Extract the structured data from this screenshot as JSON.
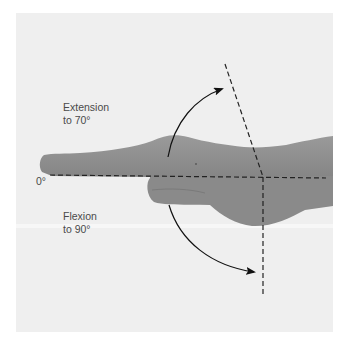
{
  "figure": {
    "labels": {
      "extension_line1": "Extension",
      "extension_line2": "to 70°",
      "flexion_line1": "Flexion",
      "flexion_line2": "to 90°",
      "zero": "0°"
    },
    "angles": {
      "neutral_deg": 0,
      "extension_deg": 70,
      "flexion_deg": 90
    },
    "colors": {
      "background": "#ffffff",
      "photo_backdrop": "#efefef",
      "skin": "#8f8f8f",
      "skin_shadow": "#7a7a7a",
      "guide_line": "#222222",
      "text": "#4a4a4a"
    }
  }
}
